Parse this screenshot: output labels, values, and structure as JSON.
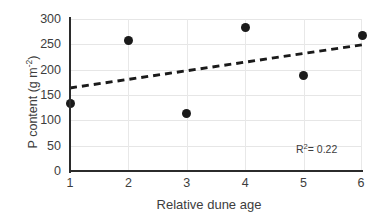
{
  "chart_data": {
    "type": "scatter",
    "title": "",
    "xlabel": "Relative dune age",
    "ylabel": "P content (g m-2)",
    "ylabel_prefix": "P content (g m",
    "ylabel_exponent": "-2",
    "ylabel_suffix": ")",
    "x": [
      1,
      2,
      3,
      4,
      5,
      6
    ],
    "values": [
      133,
      258,
      114,
      284,
      188,
      268
    ],
    "points": [
      {
        "x": 1,
        "y": 133
      },
      {
        "x": 2,
        "y": 258
      },
      {
        "x": 3,
        "y": 114
      },
      {
        "x": 4,
        "y": 284
      },
      {
        "x": 5,
        "y": 188
      },
      {
        "x": 6,
        "y": 268
      }
    ],
    "xlim": [
      1,
      6
    ],
    "ylim": [
      0,
      300
    ],
    "xticks": [
      "1",
      "2",
      "3",
      "4",
      "5",
      "6"
    ],
    "yticks": [
      "0",
      "50",
      "100",
      "150",
      "200",
      "250",
      "300"
    ],
    "ytick_values": [
      0,
      50,
      100,
      150,
      200,
      250,
      300
    ],
    "grid": "horizontal-and-vertical",
    "legend": "none",
    "series_name": "P content",
    "marker_color": "#1a1a1a",
    "marker_shape": "circle",
    "trendline": {
      "type": "linear-dashed",
      "color": "#1a1a1a",
      "x_start": 1,
      "y_start": 164,
      "x_end": 6,
      "y_end": 249
    },
    "annotations": [
      {
        "name": "r-squared",
        "prefix": "R",
        "superscript": "2",
        "text": "= 0.22",
        "value": 0.22
      }
    ]
  }
}
